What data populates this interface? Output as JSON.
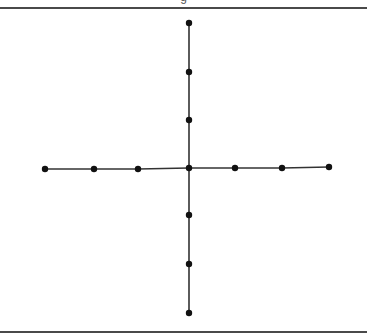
{
  "figure": {
    "caption_fragment": "g",
    "graph": {
      "type": "cross-shaped tree (spider graph)",
      "center": "c",
      "arms": [
        {
          "direction": "left",
          "vertices": 3
        },
        {
          "direction": "right",
          "vertices": 3
        },
        {
          "direction": "up",
          "vertices": 3
        },
        {
          "direction": "down",
          "vertices": 3
        }
      ],
      "total_vertices": 13,
      "total_edges": 12,
      "vertex_color": "#111111",
      "edge_color": "#333333"
    }
  }
}
